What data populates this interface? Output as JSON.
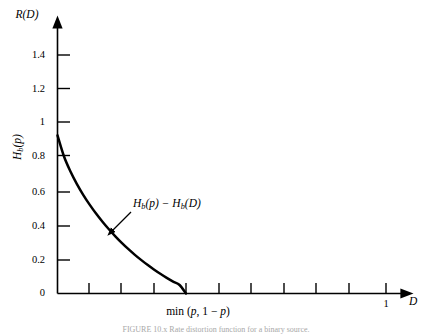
{
  "figure": {
    "caption": "FIGURE 10.x   Rate distortion function for a binary source.",
    "background_color": "#ffffff",
    "axis_color": "#000000",
    "curve_color": "#000000"
  },
  "axes": {
    "y_axis_title": "R(D)",
    "x_axis_title": "D",
    "y_axis_inline_label": "Hb(p)",
    "x_axis_region_label_prefix": "min (",
    "x_axis_region_label_p1": "p",
    "x_axis_region_label_mid": ", 1 − ",
    "x_axis_region_label_p2": "p",
    "x_axis_region_label_suffix": ")"
  },
  "annotation": {
    "curve_label": "Hb(p) − Hb(D)"
  },
  "chart_data": {
    "type": "line",
    "title": "",
    "subtitle": "",
    "xlabel": "D",
    "ylabel": "R(D)",
    "xlim": [
      0,
      1.08
    ],
    "ylim": [
      0,
      1.55
    ],
    "grid": false,
    "legend": null,
    "x_ticks": [
      0.1,
      0.2,
      0.3,
      0.4,
      0.5,
      0.6,
      0.7,
      0.8,
      0.9,
      1.0
    ],
    "x_tick_labels": [
      "",
      "",
      "",
      "",
      "",
      "",
      "",
      "",
      "",
      "1"
    ],
    "y_ticks": [
      0,
      0.2,
      0.4,
      0.6,
      0.8,
      1,
      1.2,
      1.4
    ],
    "y_tick_labels": [
      "0",
      "0.2",
      "0.4",
      "0.6",
      "0.8",
      "1",
      "1.2",
      "1.4"
    ],
    "series": [
      {
        "name": "H_b(p) - H_b(D)",
        "x": [
          0.0,
          0.0168,
          0.0335,
          0.0503,
          0.067,
          0.0838,
          0.1005,
          0.1173,
          0.134,
          0.1508,
          0.1675,
          0.1843,
          0.201,
          0.2178,
          0.2345,
          0.2513,
          0.268,
          0.2848,
          0.3015,
          0.3183,
          0.335
        ],
        "y": [
          0.93,
          0.8073,
          0.7192,
          0.6452,
          0.5806,
          0.5228,
          0.4703,
          0.4222,
          0.3777,
          0.3365,
          0.2981,
          0.2623,
          0.2289,
          0.1977,
          0.1685,
          0.1412,
          0.1158,
          0.0922,
          0.0703,
          0.0502,
          0.0
        ]
      }
    ],
    "annotations": [
      {
        "text": "H_b(p) - H_b(D)",
        "x": 0.28,
        "y": 0.53,
        "arrow_to_x": 0.148,
        "arrow_to_y": 0.353
      },
      {
        "text": "min (p, 1 - p)",
        "x": 0.335,
        "y": -0.09
      }
    ],
    "curve_start_value": 0.93,
    "curve_end_x": 0.335
  },
  "ticks": {
    "y": [
      {
        "label": "1.4",
        "y": 55
      },
      {
        "label": "1.2",
        "y": 88.5
      },
      {
        "label": "1",
        "y": 122
      },
      {
        "label": "0.8",
        "y": 155.5
      },
      {
        "label": "0.6",
        "y": 192
      },
      {
        "label": "0.4",
        "y": 226
      },
      {
        "label": "0.2",
        "y": 260
      },
      {
        "label": "0",
        "y": 293
      }
    ],
    "x": [
      {
        "label": "",
        "x": 89
      },
      {
        "label": "",
        "x": 121
      },
      {
        "label": "",
        "x": 154
      },
      {
        "label": "",
        "x": 186
      },
      {
        "label": "",
        "x": 219
      },
      {
        "label": "",
        "x": 251
      },
      {
        "label": "",
        "x": 284
      },
      {
        "label": "",
        "x": 316
      },
      {
        "label": "",
        "x": 349
      },
      {
        "label": "1",
        "x": 386
      }
    ]
  }
}
